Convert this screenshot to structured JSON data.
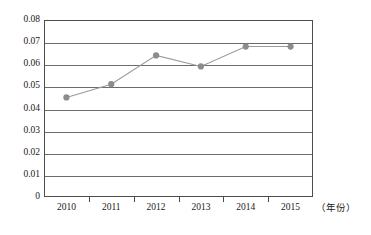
{
  "chart_data": {
    "type": "line",
    "title": "",
    "subtitle": "",
    "xlabel": "（年份）",
    "ylabel": "",
    "categories": [
      "2010",
      "2011",
      "2012",
      "2013",
      "2014",
      "2015"
    ],
    "values": [
      0.045,
      0.051,
      0.064,
      0.059,
      0.068,
      0.068
    ],
    "series": [
      {
        "name": "",
        "values": [
          0.045,
          0.051,
          0.064,
          0.059,
          0.068,
          0.068
        ]
      }
    ],
    "ylim": [
      0,
      0.08
    ],
    "ytick_labels": [
      "0.08",
      "0.07",
      "0.06",
      "0.05",
      "0.04",
      "0.03",
      "0.02",
      "0.01",
      "0"
    ],
    "ytick_values": [
      0.08,
      0.07,
      0.06,
      0.05,
      0.04,
      0.03,
      0.02,
      0.01,
      0
    ],
    "xtick_labels": [
      "2010",
      "2011",
      "2012",
      "2013",
      "2014",
      "2015"
    ],
    "grid": "horizontal",
    "legend": "none",
    "marker": "circle",
    "colors": {
      "marker": "#8c8c8c",
      "line": "#9a9a9a",
      "axis": "#4d4d4d",
      "grid": "#6b6b6b",
      "text": "#1a1a1a",
      "background": "#ffffff"
    },
    "annotations": []
  }
}
